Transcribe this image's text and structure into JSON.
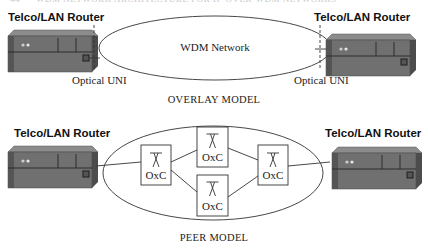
{
  "page_header": {
    "number": "44",
    "text": "WDM NETWORK ARCHITECTURE FOR IP-OVER-WDM NETWORKS"
  },
  "overlay": {
    "title": "OVERLAY MODEL",
    "cloud_label": "WDM Network",
    "left_router": {
      "label": "Telco/LAN  Router",
      "uni_label": "Optical UNI"
    },
    "right_router": {
      "label": "Telco/LAN  Router",
      "uni_label": "Optical UNI"
    }
  },
  "peer": {
    "title": "PEER MODEL",
    "left_router": {
      "label": "Telco/LAN  Router"
    },
    "right_router": {
      "label": "Telco/LAN  Router"
    },
    "nodes": [
      {
        "id": "left",
        "label": "OxC"
      },
      {
        "id": "top",
        "label": "OxC"
      },
      {
        "id": "bottom",
        "label": "OxC"
      },
      {
        "id": "right",
        "label": "OxC"
      }
    ]
  },
  "colors": {
    "router_body": "#6e6e6e",
    "router_top": "#8a8a8a",
    "router_side": "#4a4a4a",
    "line": "#333333"
  }
}
